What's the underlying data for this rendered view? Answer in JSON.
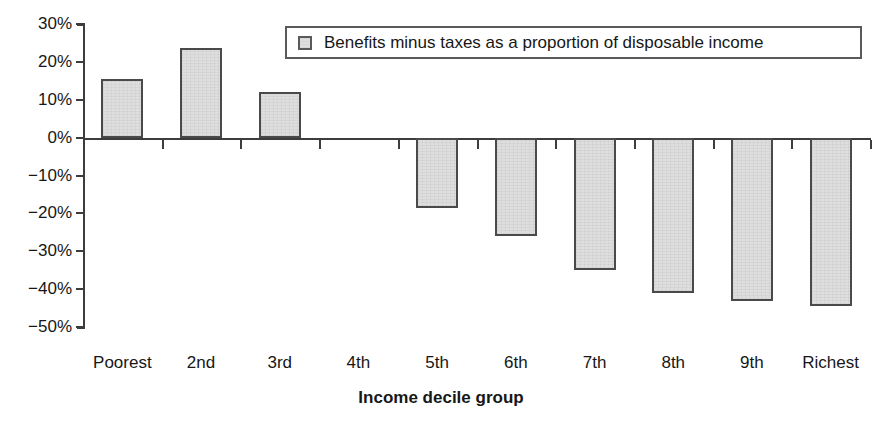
{
  "chart_data": {
    "type": "bar",
    "title": "",
    "subtitle": "",
    "xlabel": "Income decile group",
    "ylabel": "",
    "categories": [
      "Poorest",
      "2nd",
      "3rd",
      "4th",
      "5th",
      "6th",
      "7th",
      "8th",
      "9th",
      "Richest"
    ],
    "values": [
      15.4,
      23.7,
      12.1,
      0.0,
      -18.5,
      -26.0,
      -35.0,
      -41.0,
      -43.2,
      -44.5
    ],
    "series": [
      {
        "name": "Benefits minus taxes as a proportion of disposable income",
        "values": [
          15.4,
          23.7,
          12.1,
          0.0,
          -18.5,
          -26.0,
          -35.0,
          -41.0,
          -43.2,
          -44.5
        ]
      }
    ],
    "ylim": [
      -50,
      30
    ],
    "ytick_values": [
      30,
      20,
      10,
      0,
      -10,
      -20,
      -30,
      -40,
      -50
    ],
    "ytick_labels": [
      "30%",
      "20%",
      "10%",
      "0%",
      "−10%",
      "−20%",
      "−30%",
      "−40%",
      "−50%"
    ],
    "value_unit": "%",
    "grid": false,
    "legend_position": "top-center",
    "legend_entries": [
      "Benefits minus taxes as a proportion of disposable income"
    ],
    "bar_fill_color": "#dedede",
    "bar_edge_color": "#4a4a4a",
    "axis_color": "#3d3d3d",
    "background_color": "#ffffff"
  },
  "legend": {
    "label": "Benefits minus taxes as a proportion of disposable income"
  },
  "axes": {
    "x_title": "Income decile group"
  }
}
